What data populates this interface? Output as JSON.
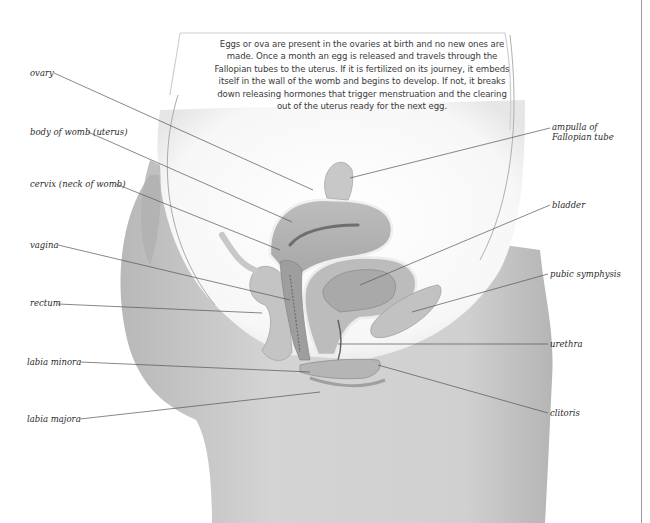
{
  "caption": {
    "text": "Eggs or ova are present in the ovaries at birth and no new ones are made. Once a month an egg is released and travels through the Fallopian tubes to the uterus. If it is fertilized on its journey, it embeds itself in the wall of the womb and begins to develop. If not, it breaks down releasing hormones that trigger menstruation and the clearing out of the uterus ready for the next egg."
  },
  "labels": {
    "left": [
      {
        "id": "ovary",
        "text": "ovary"
      },
      {
        "id": "body_of_womb",
        "text": "body of womb (uterus)"
      },
      {
        "id": "cervix",
        "text": "cervix (neck of womb)"
      },
      {
        "id": "vagina",
        "text": "vagina"
      },
      {
        "id": "rectum",
        "text": "rectum"
      },
      {
        "id": "labia_minora",
        "text": "labia minora"
      },
      {
        "id": "labia_majora",
        "text": "labia majora"
      }
    ],
    "right": [
      {
        "id": "ampulla_line1",
        "text": "ampulla of"
      },
      {
        "id": "ampulla_line2",
        "text": "Fallopian tube"
      },
      {
        "id": "bladder",
        "text": "bladder"
      },
      {
        "id": "pubic_symphysis",
        "text": "pubic symphysis"
      },
      {
        "id": "urethra",
        "text": "urethra"
      },
      {
        "id": "clitoris",
        "text": "clitoris"
      }
    ]
  },
  "colors": {
    "background": "#ffffff",
    "skin": "#c9c9c9",
    "skin_dark": "#a8a8a8",
    "organ": "#b3b3b3",
    "organ_dark": "#8f8f8f",
    "leader_line": "#555555",
    "text": "#2b2b2b"
  }
}
